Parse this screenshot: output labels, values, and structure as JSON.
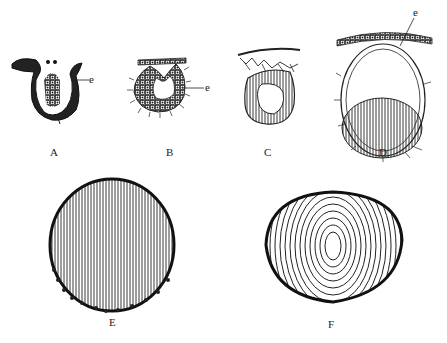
{
  "figure": {
    "panels": [
      {
        "id": "A",
        "label": "A",
        "annotation": "e"
      },
      {
        "id": "B",
        "label": "B",
        "annotation": "e"
      },
      {
        "id": "C",
        "label": "C"
      },
      {
        "id": "D",
        "label": "D",
        "annotation": "e"
      },
      {
        "id": "E",
        "label": "E"
      },
      {
        "id": "F",
        "label": "F"
      }
    ]
  },
  "colors": {
    "ink": "#1a1a1a",
    "background": "#ffffff"
  }
}
